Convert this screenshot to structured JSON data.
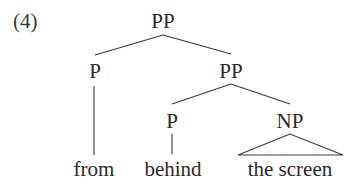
{
  "example": {
    "number": "(4)"
  },
  "tree": {
    "root": {
      "label": "PP",
      "children": {
        "left": {
          "label": "P",
          "word": "from"
        },
        "right": {
          "label": "PP",
          "children": {
            "left": {
              "label": "P",
              "word": "behind"
            },
            "right": {
              "label": "NP",
              "word": "the screen",
              "abbreviated": true
            }
          }
        }
      }
    }
  },
  "colors": {
    "text": "#2a2a2a",
    "lines": "#3a3a3a",
    "background": "#ffffff"
  }
}
